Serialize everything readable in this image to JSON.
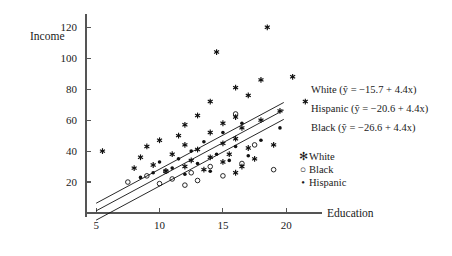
{
  "chart_data": {
    "type": "scatter",
    "title": "",
    "xlabel": "Education",
    "ylabel": "Income",
    "xlim": [
      4.2,
      22.5
    ],
    "ylim": [
      0,
      126
    ],
    "xticks": [
      5,
      10,
      15,
      20
    ],
    "yticks": [
      20,
      40,
      60,
      80,
      100,
      120
    ],
    "grid": false,
    "legend_position": "right",
    "series": [
      {
        "name": "White",
        "marker": "asterisk-star",
        "points": [
          [
            5.5,
            40.0
          ],
          [
            8.0,
            29.0
          ],
          [
            8.5,
            36.0
          ],
          [
            9.0,
            43.0
          ],
          [
            9.5,
            31.0
          ],
          [
            10.0,
            47.0
          ],
          [
            10.5,
            27.0
          ],
          [
            11.0,
            38.0
          ],
          [
            11.5,
            50.0
          ],
          [
            12.0,
            30.0
          ],
          [
            12.0,
            44.0
          ],
          [
            12.0,
            57.0
          ],
          [
            12.5,
            34.0
          ],
          [
            13.0,
            41.0
          ],
          [
            13.0,
            63.0
          ],
          [
            13.5,
            28.0
          ],
          [
            14.0,
            36.0
          ],
          [
            14.0,
            52.0
          ],
          [
            14.0,
            72.0
          ],
          [
            14.5,
            104.0
          ],
          [
            15.0,
            33.0
          ],
          [
            15.0,
            45.0
          ],
          [
            15.0,
            58.0
          ],
          [
            15.5,
            38.0
          ],
          [
            16.0,
            26.0
          ],
          [
            16.0,
            48.0
          ],
          [
            16.0,
            62.0
          ],
          [
            16.0,
            81.0
          ],
          [
            16.5,
            30.0
          ],
          [
            16.5,
            55.0
          ],
          [
            17.0,
            42.0
          ],
          [
            17.0,
            76.0
          ],
          [
            17.5,
            35.0
          ],
          [
            18.0,
            60.0
          ],
          [
            18.0,
            86.0
          ],
          [
            18.5,
            120.0
          ],
          [
            19.0,
            44.0
          ],
          [
            19.5,
            66.0
          ],
          [
            20.5,
            88.0
          ],
          [
            21.5,
            72.0
          ]
        ]
      },
      {
        "name": "Black",
        "marker": "open-circle",
        "points": [
          [
            7.5,
            20.0
          ],
          [
            9.0,
            24.0
          ],
          [
            10.0,
            19.0
          ],
          [
            10.5,
            27.0
          ],
          [
            11.0,
            22.0
          ],
          [
            12.0,
            18.0
          ],
          [
            12.5,
            26.0
          ],
          [
            13.0,
            21.0
          ],
          [
            14.0,
            30.0
          ],
          [
            15.0,
            24.0
          ],
          [
            16.0,
            64.0
          ],
          [
            16.5,
            32.0
          ],
          [
            17.5,
            44.0
          ],
          [
            19.0,
            28.0
          ]
        ]
      },
      {
        "name": "Hispanic",
        "marker": "filled-dot",
        "points": [
          [
            8.5,
            23.0
          ],
          [
            9.5,
            26.0
          ],
          [
            10.0,
            33.0
          ],
          [
            11.0,
            29.0
          ],
          [
            11.5,
            35.0
          ],
          [
            12.0,
            25.0
          ],
          [
            12.5,
            40.0
          ],
          [
            13.0,
            32.0
          ],
          [
            13.5,
            46.0
          ],
          [
            14.0,
            27.0
          ],
          [
            14.5,
            38.0
          ],
          [
            15.0,
            52.0
          ],
          [
            15.5,
            34.0
          ],
          [
            16.0,
            43.0
          ],
          [
            16.5,
            58.0
          ],
          [
            17.0,
            37.0
          ],
          [
            18.0,
            47.0
          ],
          [
            19.5,
            55.0
          ]
        ]
      }
    ],
    "regression_lines": [
      {
        "group": "White",
        "intercept": -15.7,
        "slope": 4.4,
        "equation": "White (ŷ = −15.7 + 4.4x)",
        "x_start": 5.0,
        "x_end": 19.8
      },
      {
        "group": "Hispanic",
        "intercept": -20.6,
        "slope": 4.4,
        "equation": "Hispanic (ŷ = −20.6 + 4.4x)",
        "x_start": 5.0,
        "x_end": 19.8
      },
      {
        "group": "Black",
        "intercept": -26.6,
        "slope": 4.4,
        "equation": "Black (ŷ = −26.6 + 4.4x)",
        "x_start": 5.0,
        "x_end": 19.8
      }
    ],
    "legend_entries": [
      {
        "label": "White",
        "marker": "✻"
      },
      {
        "label": "Black",
        "marker": "○"
      },
      {
        "label": "Hispanic",
        "marker": "•"
      }
    ]
  }
}
